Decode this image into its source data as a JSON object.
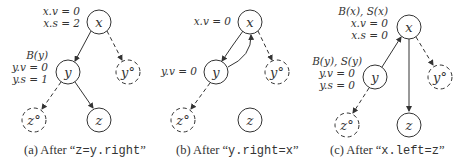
{
  "panels": [
    {
      "id": "a",
      "caption_prefix": "(a) After “",
      "caption_code": "z=y.right",
      "caption_suffix": "”",
      "nodes": {
        "x": "x",
        "y": "y",
        "y_ghost": "y°",
        "z_ghost": "z°",
        "z": "z"
      },
      "annotations": {
        "x": [
          "x.v = 0",
          "x.s = 2"
        ],
        "y": [
          "B(y)",
          "y.v = 0",
          "y.s = 1"
        ]
      }
    },
    {
      "id": "b",
      "caption_prefix": "(b) After “",
      "caption_code": "y.right=x",
      "caption_suffix": "”",
      "nodes": {
        "x": "x",
        "y": "y",
        "y_ghost": "y°",
        "z_ghost": "z°",
        "z": "z"
      },
      "annotations": {
        "x": [
          "x.v = 0"
        ],
        "y": [
          "y.v = 0"
        ]
      }
    },
    {
      "id": "c",
      "caption_prefix": "(c) After “",
      "caption_code": "x.left=z",
      "caption_suffix": "”",
      "nodes": {
        "x": "x",
        "y": "y",
        "y_ghost": "y°",
        "z_ghost": "z°",
        "z": "z"
      },
      "annotations": {
        "x": [
          "B(x), S(x)",
          "x.v = 0",
          "x.s = 0"
        ],
        "y": [
          "B(y), S(y)",
          "y.v = 0",
          "y.s = 0"
        ]
      }
    }
  ]
}
